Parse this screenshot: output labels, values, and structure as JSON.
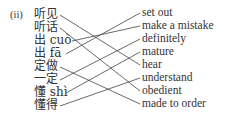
{
  "exercise_number": "(ii)",
  "left_items": [
    {
      "text": "听见",
      "y": 10
    },
    {
      "text": "听话",
      "y": 23
    },
    {
      "text": "出 cuò",
      "y": 36
    },
    {
      "text": "出 fā",
      "y": 49
    },
    {
      "text": "定做",
      "y": 62
    },
    {
      "text": "一定",
      "y": 75
    },
    {
      "text": "懂 shì",
      "y": 88
    },
    {
      "text": "懂得",
      "y": 101
    }
  ],
  "right_items": [
    {
      "text": "set out",
      "y": 8
    },
    {
      "text": "make a mistake",
      "y": 21
    },
    {
      "text": "definitely",
      "y": 34
    },
    {
      "text": "mature",
      "y": 47
    },
    {
      "text": "hear",
      "y": 60
    },
    {
      "text": "understand",
      "y": 73
    },
    {
      "text": "obedient",
      "y": 86
    },
    {
      "text": "made to order",
      "y": 99
    }
  ],
  "matches": [
    [
      0,
      4
    ],
    [
      1,
      6
    ],
    [
      2,
      1
    ],
    [
      3,
      0
    ],
    [
      4,
      7
    ],
    [
      5,
      2
    ],
    [
      6,
      3
    ],
    [
      7,
      5
    ]
  ]
}
